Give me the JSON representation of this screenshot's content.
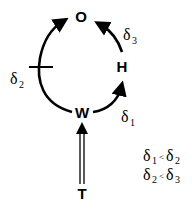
{
  "nodes": {
    "O": "O",
    "H": "H",
    "W": "W",
    "T": "T"
  },
  "labels": {
    "d1": {
      "symbol": "δ",
      "sub": "1"
    },
    "d2": {
      "symbol": "δ",
      "sub": "2"
    },
    "d3": {
      "symbol": "δ",
      "sub": "3"
    }
  },
  "inequalities": [
    {
      "left_symbol": "δ",
      "left_sub": "1",
      "op": "<",
      "right_symbol": "δ",
      "right_sub": "2"
    },
    {
      "left_symbol": "δ",
      "left_sub": "2",
      "op": "<",
      "right_symbol": "δ",
      "right_sub": "3"
    }
  ],
  "colors": {
    "stroke": "#000000",
    "background": "#ffffff"
  }
}
